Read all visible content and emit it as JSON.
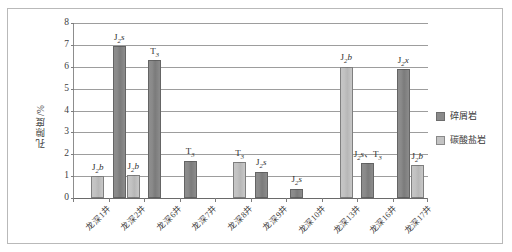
{
  "chart_data": {
    "type": "bar",
    "title": "",
    "xlabel": "",
    "ylabel": "孔隙度/%",
    "ylim": [
      0,
      8
    ],
    "yticks": [
      0,
      1,
      2,
      3,
      4,
      5,
      6,
      7,
      8
    ],
    "grid": true,
    "legend_position": "right",
    "categories": [
      "龙深1井",
      "龙深2井",
      "龙深6井",
      "龙深7井",
      "龙深8井",
      "龙深9井",
      "龙深10井",
      "龙深13井",
      "龙深16井",
      "龙深17井"
    ],
    "series": [
      {
        "name": "碎屑岩",
        "color": "#8a8a8a",
        "values": [
          null,
          6.95,
          6.3,
          1.7,
          null,
          1.2,
          0.42,
          null,
          1.6,
          5.9
        ]
      },
      {
        "name": "碳酸盐岩",
        "color": "#c3c3c3",
        "values": [
          1.0,
          1.05,
          null,
          null,
          1.65,
          null,
          null,
          6.0,
          null,
          1.5
        ]
      }
    ],
    "annotations": [
      {
        "category": "龙深1井",
        "series": "碳酸盐岩",
        "text": "J2b"
      },
      {
        "category": "龙深2井",
        "series": "碎屑岩",
        "text": "J2s"
      },
      {
        "category": "龙深2井",
        "series": "碳酸盐岩",
        "text": "J2b"
      },
      {
        "category": "龙深6井",
        "series": "碎屑岩",
        "text": "T3"
      },
      {
        "category": "龙深7井",
        "series": "碎屑岩",
        "text": "T3"
      },
      {
        "category": "龙深8井",
        "series": "碳酸盐岩",
        "text": "T3"
      },
      {
        "category": "龙深9井",
        "series": "碎屑岩",
        "text": "J2s"
      },
      {
        "category": "龙深10井",
        "series": "碎屑岩",
        "text": "J2s"
      },
      {
        "category": "龙深13井",
        "series": "碳酸盐岩",
        "text": "J2b"
      },
      {
        "category": "龙深16井",
        "series": "碎屑岩",
        "text": "J2s、T3"
      },
      {
        "category": "龙深17井",
        "series": "碎屑岩",
        "text": "J2x"
      },
      {
        "category": "龙深17井",
        "series": "碳酸盐岩",
        "text": "J2b"
      }
    ]
  },
  "axis": {
    "y_title": "孔隙度/%",
    "y_tick_labels": [
      "8",
      "7",
      "6",
      "5",
      "4",
      "3",
      "2",
      "1",
      "0"
    ]
  },
  "x_axis": {
    "labels": [
      "龙深1井",
      "龙深2井",
      "龙深6井",
      "龙深7井",
      "龙深8井",
      "龙深9井",
      "龙深10井",
      "龙深13井",
      "龙深16井",
      "龙深17井"
    ]
  },
  "legend": {
    "items": [
      {
        "label": "碎屑岩",
        "color": "#8a8a8a"
      },
      {
        "label": "碳酸盐岩",
        "color": "#c3c3c3"
      }
    ]
  },
  "bar_annotations": {
    "g0_carbonate": {
      "base": "J",
      "sub": "2",
      "tail": "b"
    },
    "g1_clastic": {
      "base": "J",
      "sub": "2",
      "tail": "s"
    },
    "g1_carbonate": {
      "base": "J",
      "sub": "2",
      "tail": "b"
    },
    "g2_clastic": {
      "base": "T",
      "sub": "3",
      "tail": ""
    },
    "g3_clastic": {
      "base": "T",
      "sub": "3",
      "tail": ""
    },
    "g4_carbonate": {
      "base": "T",
      "sub": "3",
      "tail": ""
    },
    "g5_clastic": {
      "base": "J",
      "sub": "2",
      "tail": "s"
    },
    "g6_clastic": {
      "base": "J",
      "sub": "2",
      "tail": "s"
    },
    "g7_carbonate": {
      "base": "J",
      "sub": "2",
      "tail": "b"
    },
    "g8_clastic": {
      "base": "J",
      "sub": "2",
      "tail": "s、T",
      "sub2": "3"
    },
    "g9_clastic": {
      "base": "J",
      "sub": "2",
      "tail": "x"
    },
    "g9_carbonate": {
      "base": "J",
      "sub": "2",
      "tail": "b"
    }
  }
}
